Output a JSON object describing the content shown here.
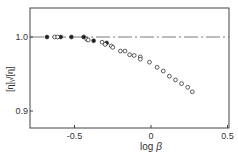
{
  "chart_data": {
    "type": "scatter",
    "title": "",
    "xlabel": "log β",
    "ylabel": "[η]ᵧ/[η]",
    "xlim": [
      -0.75,
      0.5
    ],
    "ylim": [
      0.88,
      1.04
    ],
    "xticks": [
      -0.5,
      0,
      0.5
    ],
    "xtick_labels": [
      "-0.5",
      "0",
      "0.5"
    ],
    "yticks": [
      0.9,
      1.0
    ],
    "ytick_labels": [
      "0.9",
      "1.0"
    ],
    "grid": false,
    "reference_line": {
      "y": 1.0,
      "style": "dash-dot"
    },
    "series": [
      {
        "name": "filled",
        "marker": "filled-circle",
        "x": [
          -0.68,
          -0.59,
          -0.52,
          -0.44,
          -0.375,
          -0.29
        ],
        "y": [
          1.0,
          1.0,
          1.0,
          1.0,
          0.995,
          0.992
        ]
      },
      {
        "name": "open",
        "marker": "open-circle",
        "x": [
          -0.63,
          -0.61,
          -0.42,
          -0.41,
          -0.32,
          -0.3,
          -0.26,
          -0.25,
          -0.2,
          -0.17,
          -0.14,
          -0.11,
          -0.07,
          -0.07,
          -0.01,
          0.04,
          0.08,
          0.12,
          0.16,
          0.2,
          0.24,
          0.27
        ],
        "y": [
          1.0,
          1.0,
          0.997,
          0.996,
          0.993,
          0.99,
          0.988,
          0.986,
          0.981,
          0.981,
          0.976,
          0.975,
          0.973,
          0.97,
          0.966,
          0.959,
          0.954,
          0.947,
          0.942,
          0.937,
          0.932,
          0.926
        ]
      }
    ]
  },
  "axes": {
    "x_label_main": "log",
    "x_label_greek": "β",
    "y_label": "[η]ᵧ/[η]"
  }
}
